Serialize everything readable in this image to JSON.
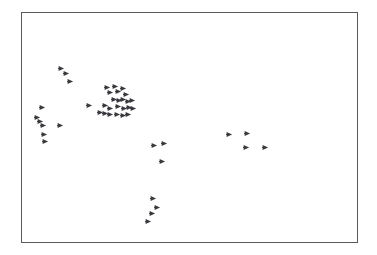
{
  "figure": {
    "background_color": "#ffffff",
    "frame": {
      "border_color": "#5a5a5e",
      "border_width_px": 1,
      "x": 21,
      "y": 12,
      "width": 337,
      "height": 231
    },
    "title": "",
    "subtitle": "",
    "xlabel": "",
    "ylabel": "",
    "marker_icon_name": "right-arrowhead-marker",
    "marker_color": "#3a3a3e",
    "marker_size_px": 7
  },
  "chart_data": {
    "type": "scatter",
    "title": "",
    "subtitle": "",
    "xlabel": "",
    "ylabel": "",
    "grid": false,
    "legend": null,
    "axis_ticks_visible": false,
    "axis_tick_labels": [],
    "marker": "right-pointing-arrowhead",
    "marker_color": "#3a3a3e",
    "xlim": [
      0,
      337
    ],
    "ylim": [
      0,
      231
    ],
    "x_axis_inverted": false,
    "y_axis_inverted": true,
    "point_count": 48,
    "coordinate_space": "plot-frame pixel offsets, origin at frame top-left",
    "clusters": [
      {
        "name": "upper-left-pair",
        "point_count": 3,
        "points": [
          {
            "x": 39,
            "y": 55
          },
          {
            "x": 44,
            "y": 60
          },
          {
            "x": 48,
            "y": 68
          }
        ]
      },
      {
        "name": "left-vertical-group",
        "point_count": 7,
        "points": [
          {
            "x": 20,
            "y": 94
          },
          {
            "x": 15,
            "y": 104
          },
          {
            "x": 18,
            "y": 108
          },
          {
            "x": 21,
            "y": 112
          },
          {
            "x": 38,
            "y": 112
          },
          {
            "x": 22,
            "y": 121
          },
          {
            "x": 23,
            "y": 128
          }
        ]
      },
      {
        "name": "main-central-cluster",
        "point_count": 24,
        "points": [
          {
            "x": 85,
            "y": 74
          },
          {
            "x": 88,
            "y": 79
          },
          {
            "x": 93,
            "y": 73
          },
          {
            "x": 96,
            "y": 78
          },
          {
            "x": 101,
            "y": 75
          },
          {
            "x": 104,
            "y": 81
          },
          {
            "x": 92,
            "y": 86
          },
          {
            "x": 97,
            "y": 87
          },
          {
            "x": 101,
            "y": 86
          },
          {
            "x": 106,
            "y": 88
          },
          {
            "x": 110,
            "y": 87
          },
          {
            "x": 67,
            "y": 92
          },
          {
            "x": 83,
            "y": 92
          },
          {
            "x": 88,
            "y": 95
          },
          {
            "x": 96,
            "y": 93
          },
          {
            "x": 102,
            "y": 95
          },
          {
            "x": 107,
            "y": 94
          },
          {
            "x": 111,
            "y": 95
          },
          {
            "x": 78,
            "y": 99
          },
          {
            "x": 83,
            "y": 100
          },
          {
            "x": 88,
            "y": 101
          },
          {
            "x": 95,
            "y": 101
          },
          {
            "x": 101,
            "y": 102
          },
          {
            "x": 106,
            "y": 101
          }
        ]
      },
      {
        "name": "mid-lower-group",
        "point_count": 3,
        "points": [
          {
            "x": 132,
            "y": 132
          },
          {
            "x": 142,
            "y": 130
          },
          {
            "x": 140,
            "y": 148
          }
        ]
      },
      {
        "name": "right-group",
        "point_count": 4,
        "points": [
          {
            "x": 207,
            "y": 121
          },
          {
            "x": 225,
            "y": 120
          },
          {
            "x": 224,
            "y": 134
          },
          {
            "x": 243,
            "y": 134
          }
        ]
      },
      {
        "name": "bottom-column-group",
        "point_count": 4,
        "points": [
          {
            "x": 131,
            "y": 185
          },
          {
            "x": 135,
            "y": 194
          },
          {
            "x": 130,
            "y": 200
          },
          {
            "x": 126,
            "y": 208
          }
        ]
      }
    ]
  }
}
